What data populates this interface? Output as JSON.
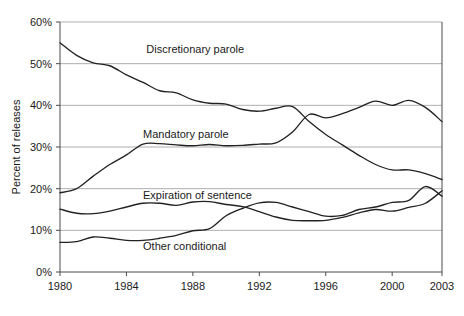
{
  "chart_data": {
    "type": "line",
    "title": "",
    "xlabel": "",
    "ylabel": "Percent of releases",
    "xlim": [
      1980,
      2003
    ],
    "ylim": [
      0,
      60
    ],
    "grid": true,
    "legend_position": "inline-annotations",
    "x_tick_labels": [
      "1980",
      "1984",
      "1988",
      "1992",
      "1996",
      "2000",
      "2003"
    ],
    "x_ticks": [
      1980,
      1984,
      1988,
      1992,
      1996,
      2000,
      2003
    ],
    "y_tick_labels": [
      "0%",
      "10%",
      "20%",
      "30%",
      "40%",
      "50%",
      "60%"
    ],
    "y_ticks": [
      0,
      10,
      20,
      30,
      40,
      50,
      60
    ],
    "x": [
      1980,
      1981,
      1982,
      1983,
      1984,
      1985,
      1986,
      1987,
      1988,
      1989,
      1990,
      1991,
      1992,
      1993,
      1994,
      1995,
      1996,
      1997,
      1998,
      1999,
      2000,
      2001,
      2002,
      2003
    ],
    "series": [
      {
        "name": "Discretionary parole",
        "label": "Discretionary parole",
        "label_x": 1985.2,
        "label_y": 53.5,
        "values": [
          55.0,
          52.0,
          50.2,
          49.5,
          47.3,
          45.5,
          43.5,
          43.0,
          41.3,
          40.5,
          40.3,
          39.0,
          38.6,
          39.3,
          39.7,
          36.1,
          33.0,
          30.5,
          28.0,
          25.8,
          24.5,
          24.5,
          23.6,
          22.2
        ]
      },
      {
        "name": "Mandatory parole",
        "label": "Mandatory parole",
        "label_x": 1985.0,
        "label_y": 33.2,
        "values": [
          19.0,
          20.0,
          23.0,
          25.8,
          28.1,
          30.7,
          30.8,
          30.5,
          30.3,
          30.6,
          30.3,
          30.4,
          30.7,
          31.0,
          33.6,
          37.8,
          37.0,
          38.0,
          39.5,
          41.0,
          40.0,
          41.2,
          39.5,
          36.1
        ]
      },
      {
        "name": "Expiration of sentence",
        "label": "Expiration of sentence",
        "label_x": 1985.0,
        "label_y": 18.4,
        "values": [
          15.1,
          14.1,
          14.0,
          14.6,
          15.6,
          16.5,
          16.5,
          16.0,
          16.8,
          16.9,
          16.2,
          15.7,
          14.5,
          13.2,
          12.4,
          12.3,
          12.4,
          13.1,
          14.2,
          15.0,
          14.6,
          15.5,
          16.5,
          19.5
        ]
      },
      {
        "name": "Other conditional",
        "label": "Other conditional",
        "label_x": 1985.0,
        "label_y": 6.2,
        "values": [
          7.1,
          7.3,
          8.4,
          8.1,
          7.6,
          7.6,
          8.1,
          8.8,
          9.9,
          10.4,
          13.5,
          15.3,
          16.6,
          16.7,
          15.6,
          14.5,
          13.4,
          13.6,
          15.0,
          15.6,
          16.7,
          17.2,
          20.5,
          18.2
        ]
      }
    ]
  },
  "axis": {
    "y_title": "Percent of releases"
  }
}
